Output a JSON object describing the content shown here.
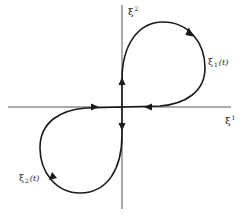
{
  "diagram": {
    "colors": {
      "axis": "#555555",
      "curve": "#1a1a1a",
      "background": "#ffffff"
    },
    "axes": {
      "horizontal": {
        "symbol": "ξ",
        "index": "1"
      },
      "vertical": {
        "symbol": "ξ",
        "index": "2"
      }
    },
    "curves": [
      {
        "id": "upper-loop",
        "symbol": "ξ",
        "index": "1",
        "arg": "(t)",
        "quadrant": "I"
      },
      {
        "id": "lower-loop",
        "symbol": "ξ",
        "index": "2",
        "arg": "(t)",
        "quadrant": "III"
      }
    ],
    "arrows": [
      {
        "location": "upper-loop-top-right",
        "direction": "clockwise"
      },
      {
        "location": "vertical-axis-above-origin",
        "direction": "up"
      },
      {
        "location": "horizontal-axis-right-of-origin",
        "direction": "left"
      },
      {
        "location": "horizontal-axis-left-of-origin",
        "direction": "right"
      },
      {
        "location": "vertical-axis-below-origin",
        "direction": "down"
      },
      {
        "location": "lower-loop-bottom-left",
        "direction": "clockwise"
      }
    ]
  }
}
